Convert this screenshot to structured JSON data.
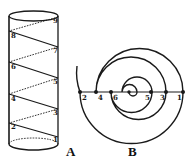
{
  "figure": {
    "panel_a": {
      "label": "A",
      "description": "cylinder with helix",
      "points": [
        {
          "id": "1",
          "side": "right",
          "x": 56,
          "y": 137
        },
        {
          "id": "2",
          "side": "left",
          "x": 11,
          "y": 124
        },
        {
          "id": "3",
          "side": "right",
          "x": 56,
          "y": 110
        },
        {
          "id": "4",
          "side": "left",
          "x": 11,
          "y": 96
        },
        {
          "id": "5",
          "side": "right",
          "x": 56,
          "y": 79
        },
        {
          "id": "6",
          "side": "left",
          "x": 11,
          "y": 64
        },
        {
          "id": "7",
          "side": "right",
          "x": 56,
          "y": 48
        },
        {
          "id": "8",
          "side": "left",
          "x": 11,
          "y": 33
        },
        {
          "id": "9",
          "side": "right",
          "x": 56,
          "y": 18
        }
      ]
    },
    "panel_b": {
      "label": "B",
      "description": "flat spiral with diameter line",
      "points": [
        {
          "id": "2",
          "x": 80
        },
        {
          "id": "4",
          "x": 96
        },
        {
          "id": "6",
          "x": 111
        },
        {
          "id": "5",
          "x": 151
        },
        {
          "id": "3",
          "x": 166
        },
        {
          "id": "1",
          "x": 183
        }
      ]
    },
    "colors": {
      "ink": "#1a1a1a",
      "background": "#ffffff"
    }
  }
}
